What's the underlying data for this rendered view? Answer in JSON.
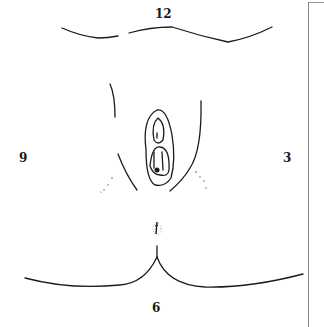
{
  "diagram": {
    "type": "anatomical clock-position chart",
    "labels": {
      "top": "12",
      "right": "3",
      "bottom": "6",
      "left": "9"
    },
    "stroke_color": "#1a1a1a",
    "background": "#ffffff"
  }
}
